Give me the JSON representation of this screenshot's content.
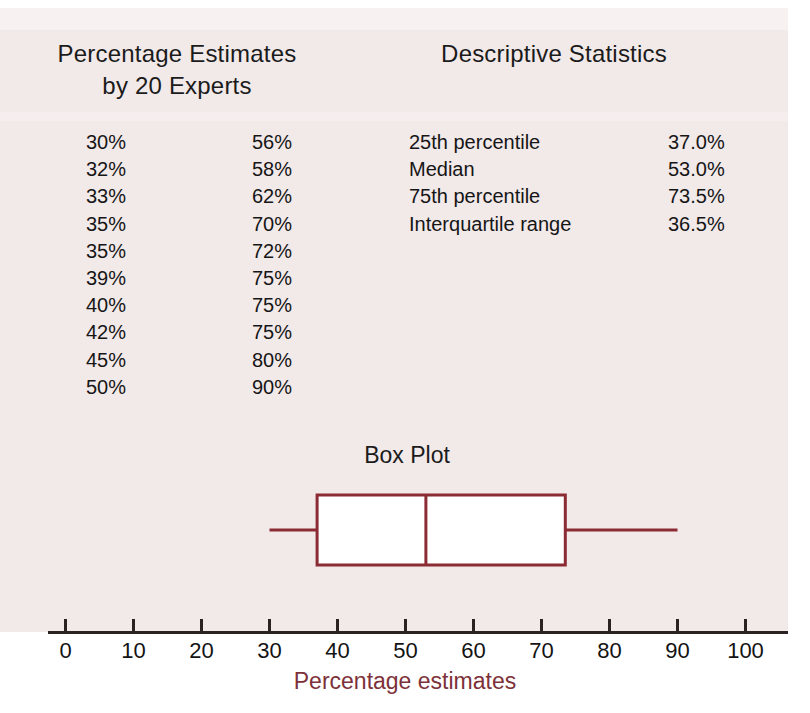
{
  "headers": {
    "left": "Percentage Estimates\nby 20 Experts",
    "right": "Descriptive Statistics"
  },
  "boxplot_title": "Box Plot",
  "axis": {
    "label": "Percentage estimates",
    "ticks": [
      "0",
      "10",
      "20",
      "30",
      "40",
      "50",
      "60",
      "70",
      "80",
      "90",
      "100"
    ],
    "min": 0,
    "max": 100,
    "step": 10
  },
  "estimates_rows": [
    [
      "30%",
      "56%"
    ],
    [
      "32%",
      "58%"
    ],
    [
      "33%",
      "62%"
    ],
    [
      "35%",
      "70%"
    ],
    [
      "35%",
      "72%"
    ],
    [
      "39%",
      "75%"
    ],
    [
      "40%",
      "75%"
    ],
    [
      "42%",
      "75%"
    ],
    [
      "45%",
      "80%"
    ],
    [
      "50%",
      "90%"
    ]
  ],
  "statistics": [
    {
      "label": "25th percentile",
      "value": "37.0%"
    },
    {
      "label": "Median",
      "value": "53.0%"
    },
    {
      "label": "75th percentile",
      "value": "73.5%"
    },
    {
      "label": "Interquartile range",
      "value": "36.5%"
    }
  ],
  "colors": {
    "paper": "#f2e9e9",
    "box_stroke": "#8b2b33",
    "axis_label": "#7d3139",
    "axis_line": "#2a2322",
    "text": "#161616",
    "box_fill": "#ffffff"
  },
  "chart_data": {
    "type": "box",
    "title": "Box Plot",
    "xlabel": "Percentage estimates",
    "ylabel": "",
    "xlim": [
      0,
      100
    ],
    "xticks": [
      0,
      10,
      20,
      30,
      40,
      50,
      60,
      70,
      80,
      90,
      100
    ],
    "grid": false,
    "legend": "none",
    "orientation": "horizontal",
    "data": [
      30,
      32,
      33,
      35,
      35,
      39,
      40,
      42,
      45,
      50,
      56,
      58,
      62,
      70,
      72,
      75,
      75,
      75,
      80,
      90
    ],
    "n": 20,
    "box": {
      "whisker_low": 30,
      "q1": 37.0,
      "median": 53.0,
      "q3": 73.5,
      "whisker_high": 90,
      "iqr": 36.5
    },
    "summary_table": {
      "columns": [
        "Statistic",
        "Value"
      ],
      "rows": [
        [
          "25th percentile",
          "37.0%"
        ],
        [
          "Median",
          "53.0%"
        ],
        [
          "75th percentile",
          "73.5%"
        ],
        [
          "Interquartile range",
          "36.5%"
        ]
      ]
    }
  }
}
